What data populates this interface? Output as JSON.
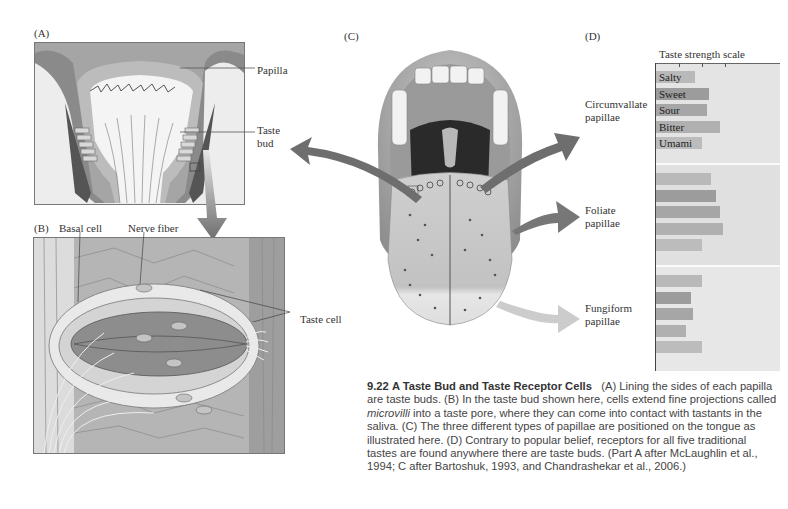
{
  "figure": {
    "number": "9.22",
    "title": "A Taste Bud and Taste Receptor Cells",
    "caption_parts": {
      "part1": "(A) Lining the sides of each papilla are taste buds. (B) In the taste bud shown here, cells extend fine projections called ",
      "italic": "microvilli",
      "part2": " into a taste pore, where they can come into contact with tastants in the saliva. (C) The three different types of papillae are positioned on the tongue as illustrated here. (D) Contrary to popular belief, receptors for all five traditional tastes are found anywhere there are taste buds. (Part A after McLaughlin et al., 1994; C after Bartoshuk, 1993, and Chandrashekar et al., 2006.)"
    }
  },
  "panel_a": {
    "letter": "(A)",
    "labels": {
      "papilla": "Papilla",
      "taste_bud_line1": "Taste",
      "taste_bud_line2": "bud"
    }
  },
  "panel_b": {
    "letter": "(B)",
    "labels": {
      "basal_cell": "Basal cell",
      "nerve_fiber": "Nerve fiber",
      "taste_cell": "Taste cell"
    }
  },
  "panel_c": {
    "letter": "(C)",
    "labels": {
      "circumvallate_line1": "Circumvallate",
      "circumvallate_line2": "papillae",
      "foliate_line1": "Foliate",
      "foliate_line2": "papillae",
      "fungiform_line1": "Fungiform",
      "fungiform_line2": "papillae"
    }
  },
  "panel_d": {
    "letter": "(D)",
    "title": "Taste strength scale"
  },
  "colors": {
    "arrow_dark": "#6e6e6e",
    "arrow_light": "#c8c8c8",
    "chart_bg": "#e4e4e4",
    "bar_salty": "#b9b9b9",
    "bar_sweet": "#9c9c9c",
    "bar_sour": "#a6a6a6",
    "bar_bitter": "#b0b0b0",
    "bar_umami": "#bcbcbc"
  },
  "chart_data": {
    "type": "bar",
    "orientation": "horizontal",
    "title": "Taste strength scale",
    "xlabel": "Taste strength",
    "ylabel": "",
    "xlim": [
      0,
      3
    ],
    "ticks": [
      1,
      2,
      3
    ],
    "tick_labels": [],
    "grid": false,
    "legend": "inline labels on first group",
    "categories": [
      "Salty",
      "Sweet",
      "Sour",
      "Bitter",
      "Umami"
    ],
    "groups": [
      "Circumvallate papillae",
      "Foliate papillae",
      "Fungiform papillae"
    ],
    "series": [
      {
        "name": "Circumvallate papillae",
        "values": [
          1.7,
          2.3,
          2.2,
          2.8,
          2.0
        ]
      },
      {
        "name": "Foliate papillae",
        "values": [
          2.4,
          2.6,
          2.8,
          2.9,
          2.0
        ]
      },
      {
        "name": "Fungiform papillae",
        "values": [
          2.0,
          1.5,
          1.6,
          1.3,
          2.0
        ]
      }
    ]
  }
}
